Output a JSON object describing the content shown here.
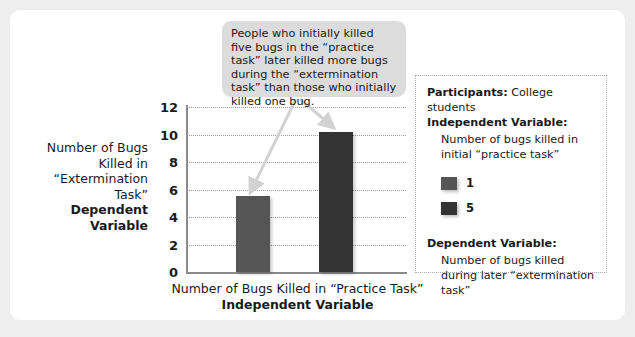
{
  "figure": {
    "background_color": "#eeeeee",
    "card_color": "#ffffff"
  },
  "callout": {
    "text": "People who initially killed five bugs in the “practice task” later killed more bugs during the “extermination task” than those who initially killed one bug.",
    "background_color": "#dcdcdc"
  },
  "panel": {
    "participants_label": "Participants:",
    "participants_value": " College students",
    "iv_label": "Independent Variable:",
    "iv_text": "Number of bugs killed in initial “practice task”",
    "legend": [
      {
        "label": "1",
        "color": "#555555"
      },
      {
        "label": "5",
        "color": "#333333"
      }
    ],
    "dv_label": "Dependent Variable:",
    "dv_text": "Number of bugs killed during later “extermination task”"
  },
  "chart_data": {
    "type": "bar",
    "title": "",
    "categories": [
      "1",
      "5"
    ],
    "values": [
      5.5,
      10.2
    ],
    "series": [
      {
        "name": "Number of bugs killed in “extermination task”",
        "values": [
          5.5,
          10.2
        ],
        "colors": [
          "#555555",
          "#333333"
        ]
      }
    ],
    "xlabel": "Number of Bugs Killed in “Practice Task”",
    "xlabel_sub": "Independent Variable",
    "ylabel": "Number of Bugs Killed in “Extermination Task”",
    "ylabel_sub": "Dependent Variable",
    "ylim": [
      0,
      12
    ],
    "yticks": [
      0,
      2,
      4,
      6,
      8,
      10,
      12
    ],
    "ytick_labels": [
      "0",
      "2",
      "4",
      "6",
      "8",
      "10",
      "12"
    ],
    "grid": true,
    "grid_style": "dotted",
    "legend_position": "right-panel",
    "annotations": [
      {
        "text": "People who initially killed five bugs in the “practice task” later killed more bugs during the “extermination task” than those who initially killed one bug.",
        "points_to": [
          "bar-1",
          "bar-5"
        ]
      }
    ]
  }
}
